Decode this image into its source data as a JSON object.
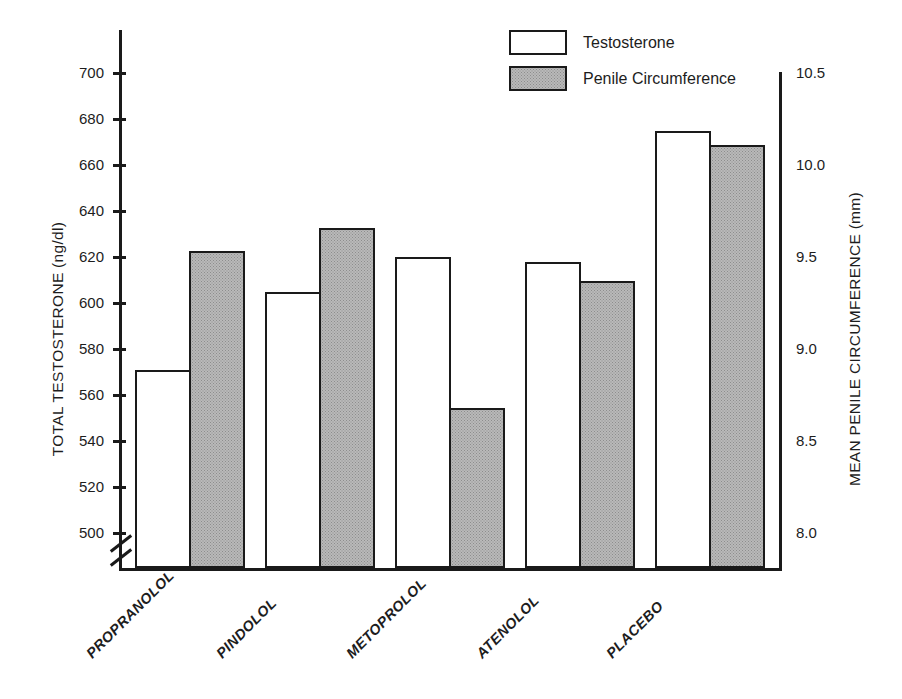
{
  "chart_data": {
    "type": "bar",
    "title": "",
    "categories": [
      "PROPRANOLOL",
      "PINDOLOL",
      "METOPROLOL",
      "ATENOLOL",
      "PLACEBO"
    ],
    "series": [
      {
        "name": "Testosterone",
        "axis": "left",
        "unit": "ng/dl",
        "fill": "white",
        "values": [
          571,
          605,
          620,
          618,
          675
        ]
      },
      {
        "name": "Penile Circumference",
        "axis": "right",
        "unit": "mm",
        "fill": "gray-stipple",
        "values": [
          9.53,
          9.66,
          8.68,
          9.37,
          10.11
        ]
      }
    ],
    "xlabel": "",
    "ylabel": "TOTAL TESTOSTERONE (ng/dl)",
    "y2label": "MEAN PENILE CIRCUMFERENCE (mm)",
    "ylim": [
      500,
      700
    ],
    "y2lim": [
      8.0,
      10.5
    ],
    "yticks": [
      500,
      520,
      540,
      560,
      580,
      600,
      620,
      640,
      660,
      680,
      700
    ],
    "y2ticks": [
      "8.0",
      "8.5",
      "9.0",
      "9.5",
      "10.0",
      "10.5"
    ],
    "y_axis_break": true,
    "grid": false,
    "legend_position": "top-center"
  },
  "axes": {
    "left": {
      "title": "TOTAL TESTOSTERONE (ng/dl)",
      "ticks": [
        "700",
        "680",
        "660",
        "640",
        "620",
        "600",
        "580",
        "560",
        "540",
        "520",
        "500"
      ]
    },
    "right": {
      "title": "MEAN PENILE CIRCUMFERENCE (mm)",
      "ticks": [
        "10.5",
        "10.0",
        "9.5",
        "9.0",
        "8.5",
        "8.0"
      ]
    }
  },
  "legend": {
    "items": [
      {
        "label": "Testosterone",
        "swatch": "white-box"
      },
      {
        "label": "Penile Circumference",
        "swatch": "gray-stipple-box"
      }
    ]
  },
  "colors": {
    "ink": "#1a1a1a",
    "bar_testosterone": "#ffffff",
    "bar_circumference": "#b9b9b9",
    "background": "#ffffff"
  }
}
